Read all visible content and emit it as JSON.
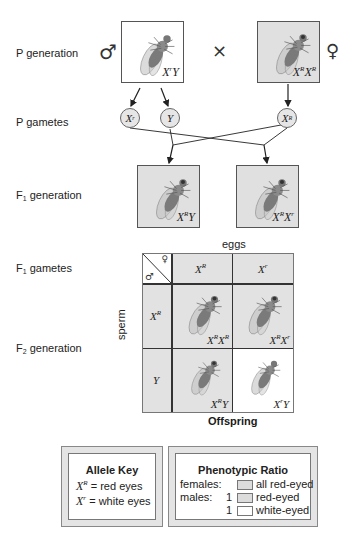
{
  "row_labels": {
    "p_generation": "P generation",
    "p_gametes": "P gametes",
    "f1_generation_prefix": "F",
    "f1_generation_sub": "1",
    "f1_generation_suffix": " generation",
    "f1_gametes_prefix": "F",
    "f1_gametes_sub": "1",
    "f1_gametes_suffix": " gametes",
    "f2_generation_prefix": "F",
    "f2_generation_sub": "2",
    "f2_generation_suffix": " generation"
  },
  "symbols": {
    "male": "♂",
    "female": "♀",
    "cross": "×"
  },
  "p_generation": {
    "male": {
      "genotype_base1": "X",
      "genotype_sup1": "r",
      "genotype_base2": "Y",
      "genotype_sup2": "",
      "eye_color": "white",
      "box_fill": "#ffffff"
    },
    "female": {
      "genotype_base1": "X",
      "genotype_sup1": "R",
      "genotype_base2": "X",
      "genotype_sup2": "R",
      "eye_color": "red",
      "box_fill": "#e0e0e0"
    }
  },
  "p_gametes": [
    {
      "base": "X",
      "sup": "r"
    },
    {
      "base": "Y",
      "sup": ""
    },
    {
      "base": "X",
      "sup": "R"
    }
  ],
  "f1_generation": [
    {
      "genotype_base1": "X",
      "genotype_sup1": "R",
      "genotype_base2": "Y",
      "genotype_sup2": "",
      "eye_color": "red"
    },
    {
      "genotype_base1": "X",
      "genotype_sup1": "R",
      "genotype_base2": "X",
      "genotype_sup2": "r",
      "eye_color": "red"
    }
  ],
  "punnett": {
    "eggs_label": "eggs",
    "sperm_label": "sperm",
    "offspring_label": "Offspring",
    "egg_alleles": [
      {
        "base": "X",
        "sup": "R"
      },
      {
        "base": "X",
        "sup": "r"
      }
    ],
    "sperm_alleles": [
      {
        "base": "X",
        "sup": "R"
      },
      {
        "base": "Y",
        "sup": ""
      }
    ],
    "cells": [
      [
        {
          "g1": "X",
          "s1": "R",
          "g2": "X",
          "s2": "R",
          "eye_color": "red",
          "fill": "#e0e0e0"
        },
        {
          "g1": "X",
          "s1": "R",
          "g2": "X",
          "s2": "r",
          "eye_color": "red",
          "fill": "#e0e0e0"
        }
      ],
      [
        {
          "g1": "X",
          "s1": "R",
          "g2": "Y",
          "s2": "",
          "eye_color": "red",
          "fill": "#e0e0e0"
        },
        {
          "g1": "X",
          "s1": "r",
          "g2": "Y",
          "s2": "",
          "eye_color": "white",
          "fill": "#ffffff"
        }
      ]
    ]
  },
  "allele_key": {
    "title": "Allele Key",
    "entries": [
      {
        "base": "X",
        "sup": "R",
        "eq": "=",
        "meaning": "red eyes"
      },
      {
        "base": "X",
        "sup": "r",
        "eq": "=",
        "meaning": "white eyes"
      }
    ]
  },
  "phenotypic_ratio": {
    "title": "Phenotypic Ratio",
    "rows": [
      {
        "group": "females:",
        "count": "",
        "swatch": "#dcdcdc",
        "label": "all red-eyed"
      },
      {
        "group": "males:",
        "count": "1",
        "swatch": "#dcdcdc",
        "label": "red-eyed"
      },
      {
        "group": "",
        "count": "1",
        "swatch": "#ffffff",
        "label": "white-eyed"
      }
    ]
  },
  "colors": {
    "gray_fill": "#e0e0e0",
    "white_fill": "#ffffff",
    "line": "#333333"
  }
}
